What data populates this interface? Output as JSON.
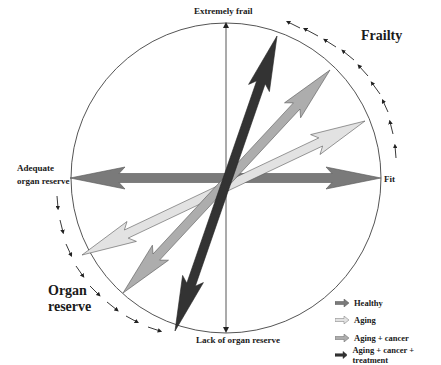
{
  "diagram": {
    "axis_labels": {
      "top": "Extremely frail",
      "bottom": "Lack of organ reserve",
      "left_line1": "Adequate",
      "left_line2": "organ reserve",
      "right": "Fit"
    },
    "quadrant_labels": {
      "upper_right": "Frailty",
      "lower_left_line1": "Organ",
      "lower_left_line2": "reserve"
    },
    "legend": [
      {
        "label": "Healthy",
        "color": "#7a7a7a"
      },
      {
        "label": "Aging",
        "color": "#e2e2e2"
      },
      {
        "label": "Aging + cancer",
        "color": "#adadad"
      },
      {
        "label": "Aging + cancer + treatment",
        "color": "#333333"
      }
    ],
    "arrows": [
      {
        "name": "Healthy",
        "from": [
          70,
          178
        ],
        "to": [
          381,
          178
        ],
        "color": "#7a7a7a"
      },
      {
        "name": "Aging",
        "from": [
          82,
          255
        ],
        "to": [
          365,
          121
        ],
        "color": "#e2e2e2"
      },
      {
        "name": "Aging + cancer",
        "from": [
          123,
          293
        ],
        "to": [
          330,
          70
        ],
        "color": "#adadad"
      },
      {
        "name": "Aging + cancer + treatment",
        "from": [
          175,
          331
        ],
        "to": [
          277,
          36
        ],
        "color": "#333333"
      }
    ]
  }
}
